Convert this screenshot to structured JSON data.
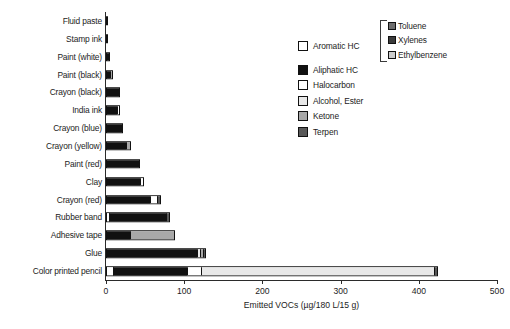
{
  "chart_data": {
    "type": "bar",
    "orientation": "horizontal",
    "title": "",
    "xlabel": "Emitted VOCs (µg/180 L/15 g)",
    "ylabel": "",
    "xlim": [
      0,
      500
    ],
    "xticks": [
      0,
      100,
      200,
      300,
      400,
      500
    ],
    "xtick_labels": [
      "0",
      "100",
      "200",
      "300",
      "400",
      "500"
    ],
    "grid": false,
    "legend_position": "upper-right",
    "stacked": true,
    "categories": [
      "Fluid paste",
      "Stamp ink",
      "Paint (white)",
      "Paint (black)",
      "Crayon (black)",
      "India ink",
      "Crayon (blue)",
      "Crayon (yellow)",
      "Paint (red)",
      "Clay",
      "Crayon (red)",
      "Rubber band",
      "Adhesive tape",
      "Glue",
      "Color printed pencil"
    ],
    "series": [
      {
        "name": "Aromatic HC",
        "values": [
          0,
          0,
          0,
          0,
          0,
          0,
          0,
          0,
          0,
          0,
          0,
          2,
          0,
          0,
          8
        ]
      },
      {
        "name": "Aliphatic HC",
        "values": [
          2,
          2,
          5,
          5,
          18,
          15,
          22,
          26,
          43,
          45,
          57,
          76,
          30,
          118,
          95
        ]
      },
      {
        "name": "Halocarbon",
        "values": [
          0,
          0,
          0,
          0,
          0,
          3,
          0,
          0,
          0,
          3,
          9,
          0,
          0,
          0,
          18
        ]
      },
      {
        "name": "Alcohol, Ester",
        "values": [
          0,
          0,
          0,
          0,
          0,
          0,
          0,
          0,
          0,
          0,
          0,
          0,
          0,
          4,
          300
        ]
      },
      {
        "name": "Ketone",
        "values": [
          0,
          0,
          0,
          4,
          0,
          0,
          0,
          6,
          0,
          0,
          0,
          0,
          58,
          3,
          0
        ]
      },
      {
        "name": "Terpen",
        "values": [
          0,
          0,
          0,
          0,
          0,
          0,
          0,
          0,
          0,
          0,
          4,
          4,
          0,
          3,
          4
        ]
      }
    ],
    "totals": [
      2,
      2,
      5,
      9,
      18,
      18,
      22,
      32,
      43,
      48,
      70,
      82,
      88,
      128,
      425
    ],
    "colors": {
      "Aromatic HC": "#ffffff",
      "Aliphatic HC": "#111111",
      "Halocarbon": "#ffffff",
      "Alcohol, Ester": "#e8e8e8",
      "Ketone": "#a8a8a8",
      "Terpen": "#585858",
      "Toluene": "#6e6e6e",
      "Xylenes": "#3b3b3b",
      "Ethylbenzene": "#cccccc",
      "axis": "#2b2b2b",
      "text": "#1c1c1c"
    }
  },
  "legend": {
    "items": [
      {
        "label": "Aromatic HC",
        "swatch": "legend-swatch-aromatic-hc"
      },
      {
        "label": "Aliphatic HC",
        "swatch": "legend-swatch-aliphatic-hc"
      },
      {
        "label": "Halocarbon",
        "swatch": "legend-swatch-halocarbon"
      },
      {
        "label": "Alcohol, Ester",
        "swatch": "legend-swatch-alcohol-ester"
      },
      {
        "label": "Ketone",
        "swatch": "legend-swatch-ketone"
      },
      {
        "label": "Terpen",
        "swatch": "legend-swatch-terpen"
      }
    ],
    "sub_items": [
      {
        "label": "Toluene",
        "swatch": "legend-swatch-toluene"
      },
      {
        "label": "Xylenes",
        "swatch": "legend-swatch-xylenes"
      },
      {
        "label": "Ethylbenzene",
        "swatch": "legend-swatch-ethylbenzene"
      }
    ]
  }
}
